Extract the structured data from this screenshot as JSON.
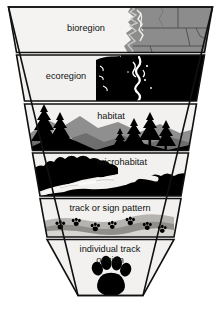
{
  "figure": {
    "type": "funnel-hierarchy-diagram",
    "caption": "",
    "background_color": "#ffffff",
    "outline_color": "#111111",
    "band_fill_color": "#f2f1ef",
    "dark_fill_color": "#000000",
    "mid_gray_color": "#8b8b8b",
    "light_gray_color": "#d6d5d2"
  },
  "bands": [
    {
      "id": "bioregion",
      "label": "bioregion",
      "order": 1,
      "imagery": "grayscale-map-pacific-northwest",
      "imagery_name": "bioregion-map-image"
    },
    {
      "id": "ecoregion",
      "label": "ecoregion",
      "order": 2,
      "imagery": "black-silhouette-puget-sound-ecoregion",
      "imagery_name": "ecoregion-map-image"
    },
    {
      "id": "habitat",
      "label": "habitat",
      "order": 3,
      "imagery": "mountain-ridge-with-conifer-trees",
      "imagery_name": "habitat-landscape-image"
    },
    {
      "id": "microhabitat",
      "label": "microhabitat",
      "order": 4,
      "imagery": "stream-bank-silhouette",
      "imagery_name": "microhabitat-stream-image"
    },
    {
      "id": "track-or-sign-pattern",
      "label": "track or sign pattern",
      "order": 5,
      "imagery": "trail-of-small-paw-prints-in-sand",
      "imagery_name": "track-pattern-image"
    },
    {
      "id": "individual-track-or-sign",
      "label": "individual track\nor sign",
      "label_line1": "individual track",
      "label_line2": "or sign",
      "order": 6,
      "imagery": "single-large-paw-print",
      "imagery_name": "paw-print-image"
    }
  ]
}
